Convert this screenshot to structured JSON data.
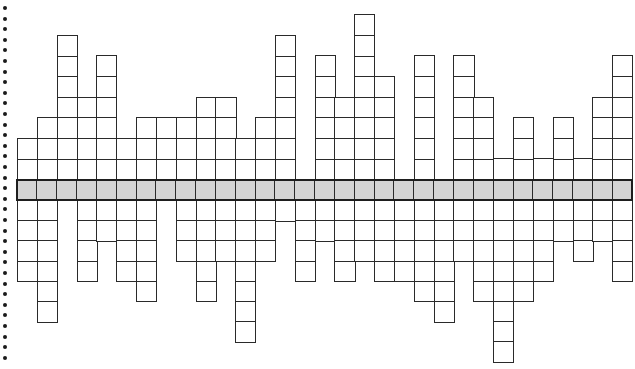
{
  "diagram": {
    "type": "symmetric-column-grid",
    "columns": 31,
    "band": {
      "label": "",
      "fill_color": "#d4d4d4",
      "border_color": "#1e1e1e"
    },
    "cells_above_band": [
      2,
      3,
      7,
      4,
      6,
      2,
      3,
      3,
      3,
      4,
      4,
      2,
      3,
      7,
      0,
      6,
      4,
      8,
      5,
      0,
      6,
      0,
      6,
      4,
      1,
      3,
      1,
      3,
      1,
      4,
      6
    ],
    "cells_below_band": [
      4,
      6,
      0,
      4,
      2,
      4,
      5,
      0,
      3,
      5,
      3,
      7,
      3,
      1,
      4,
      2,
      4,
      3,
      4,
      4,
      5,
      6,
      3,
      5,
      8,
      5,
      4,
      2,
      3,
      2,
      4
    ],
    "cell_border_color": "#2a2a2a",
    "margin": {
      "style": "dotted-binding-edge",
      "dot_count": 34,
      "dot_color": "#1a1a1a"
    }
  }
}
